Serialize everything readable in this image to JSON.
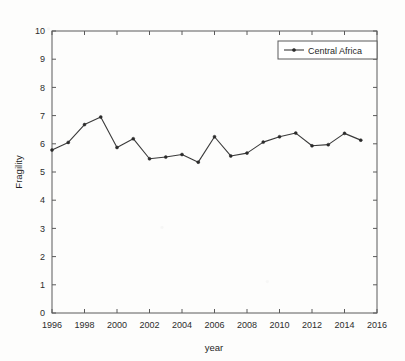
{
  "chart_data": {
    "type": "line",
    "title": "",
    "subtitle": "",
    "xlabel": "year",
    "ylabel": "Fragility",
    "xlim": [
      1996,
      2016
    ],
    "ylim": [
      0,
      10
    ],
    "grid": false,
    "legend_position": "top-right",
    "x_ticks": [
      1996,
      1998,
      2000,
      2002,
      2004,
      2006,
      2008,
      2010,
      2012,
      2014,
      2016
    ],
    "y_ticks": [
      0,
      1,
      2,
      3,
      4,
      5,
      6,
      7,
      8,
      9,
      10
    ],
    "x": [
      1996,
      1997,
      1998,
      1999,
      2000,
      2001,
      2002,
      2003,
      2004,
      2005,
      2006,
      2007,
      2008,
      2009,
      2010,
      2011,
      2012,
      2013,
      2014,
      2015
    ],
    "series": [
      {
        "name": "Central Africa",
        "color": "#3a3a3a",
        "marker": "dot",
        "values": [
          5.78,
          6.05,
          6.68,
          6.95,
          5.87,
          6.18,
          5.47,
          5.53,
          5.62,
          5.35,
          6.25,
          5.57,
          5.67,
          6.06,
          6.25,
          6.38,
          5.93,
          5.97,
          6.37,
          6.13
        ]
      }
    ]
  },
  "legend": {
    "entries": [
      {
        "label": "Central Africa"
      }
    ]
  },
  "axes": {
    "x_title": "year",
    "y_title": "Fragility"
  }
}
